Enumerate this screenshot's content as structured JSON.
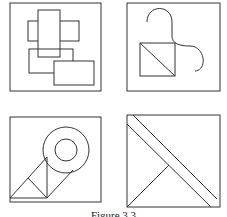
{
  "figure": {
    "caption": "Figure 3.3",
    "stroke_color": "#333333",
    "background": "#ffffff",
    "panels": [
      {
        "id": "panel-top-left",
        "description": "overlapping rectangles"
      },
      {
        "id": "panel-top-right",
        "description": "square with diagonal and S-curve"
      },
      {
        "id": "panel-bottom-left",
        "description": "concentric circles with triangles"
      },
      {
        "id": "panel-bottom-right",
        "description": "square with diagonal band and triangle"
      }
    ]
  }
}
